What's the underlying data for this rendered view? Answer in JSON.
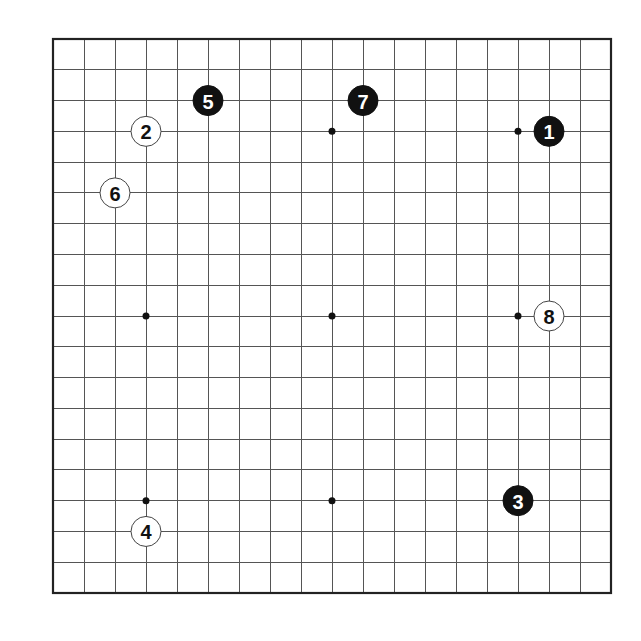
{
  "board": {
    "size": 19,
    "left": 53,
    "top": 39,
    "right": 611,
    "bottom": 593,
    "line_color": "#555555",
    "border_color": "#222222",
    "background": "#ffffff",
    "star_points": [
      [
        3,
        3
      ],
      [
        9,
        3
      ],
      [
        15,
        3
      ],
      [
        3,
        9
      ],
      [
        9,
        9
      ],
      [
        15,
        9
      ],
      [
        3,
        15
      ],
      [
        9,
        15
      ],
      [
        15,
        15
      ]
    ]
  },
  "stones": [
    {
      "move": "1",
      "color": "black",
      "col": 16,
      "row": 3
    },
    {
      "move": "2",
      "color": "white",
      "col": 3,
      "row": 3
    },
    {
      "move": "3",
      "color": "black",
      "col": 15,
      "row": 15
    },
    {
      "move": "4",
      "color": "white",
      "col": 3,
      "row": 16
    },
    {
      "move": "5",
      "color": "black",
      "col": 5,
      "row": 2
    },
    {
      "move": "6",
      "color": "white",
      "col": 2,
      "row": 5
    },
    {
      "move": "7",
      "color": "black",
      "col": 10,
      "row": 2
    },
    {
      "move": "8",
      "color": "white",
      "col": 16,
      "row": 9
    }
  ],
  "stone_radius": 15
}
